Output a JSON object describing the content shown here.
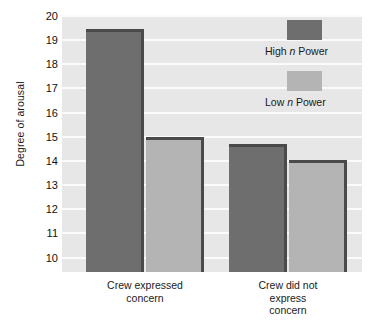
{
  "chart_data": {
    "type": "bar",
    "title": "",
    "xlabel": "",
    "ylabel": "Degree of arousal",
    "ylim": [
      9.4,
      20
    ],
    "yticks": [
      10,
      11,
      12,
      13,
      14,
      15,
      16,
      17,
      18,
      19,
      20
    ],
    "ytick_labels": [
      "10",
      "11",
      "12",
      "13",
      "14",
      "15",
      "16",
      "17",
      "18",
      "19",
      "20"
    ],
    "grid": true,
    "legend_position": "top-right",
    "categories": [
      "Crew expressed concern",
      "Crew did not express concern"
    ],
    "category_labels_wrapped": [
      "Crew expressed\nconcern",
      "Crew did not\nexpress\nconcern"
    ],
    "series": [
      {
        "name": "High n Power",
        "name_prefix": "High ",
        "name_italic": "n",
        "name_suffix": " Power",
        "color": "#6e6e6e",
        "values": [
          19.45,
          14.7
        ]
      },
      {
        "name": "Low n Power",
        "name_prefix": "Low ",
        "name_italic": "n",
        "name_suffix": " Power",
        "color": "#b4b4b4",
        "values": [
          15.0,
          14.05
        ]
      }
    ],
    "colors": {
      "plot_background": "#e7e7e7",
      "gridline": "#fbfbfb",
      "bar_high": "#6e6e6e",
      "bar_low": "#b4b4b4",
      "bar_edge_shadow": "#4a4a4a",
      "text": "#1a1a1a",
      "page_background": "#ffffff"
    }
  }
}
